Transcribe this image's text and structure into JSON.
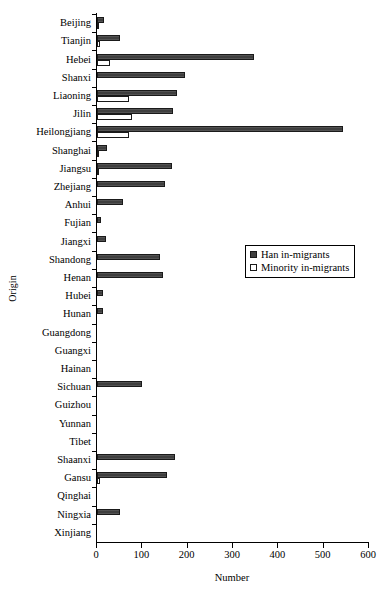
{
  "chart_data": {
    "type": "bar",
    "orientation": "horizontal",
    "title": "",
    "xlabel": "Number",
    "ylabel": "Origin",
    "xlim": [
      0,
      600
    ],
    "xticks": [
      0,
      100,
      200,
      300,
      400,
      500,
      600
    ],
    "grid": false,
    "legend_position": "middle-right",
    "categories": [
      "Beijing",
      "Tianjin",
      "Hebei",
      "Shanxi",
      "Liaoning",
      "Jilin",
      "Heilongjiang",
      "Shanghai",
      "Jiangsu",
      "Zhejiang",
      "Anhui",
      "Fujian",
      "Jiangxi",
      "Shandong",
      "Henan",
      "Hubei",
      "Hunan",
      "Guangdong",
      "Guangxi",
      "Hainan",
      "Sichuan",
      "Guizhou",
      "Yunnan",
      "Tibet",
      "Shaanxi",
      "Gansu",
      "Qinghai",
      "Ningxia",
      "Xinjiang"
    ],
    "series": [
      {
        "name": "Han in-migrants",
        "color": "#3f3f3f",
        "values": [
          15,
          51,
          346,
          194,
          176,
          168,
          542,
          22,
          165,
          150,
          57,
          9,
          20,
          140,
          145,
          13,
          13,
          0,
          0,
          0,
          99,
          0,
          0,
          0,
          171,
          154,
          0,
          51,
          0
        ]
      },
      {
        "name": "Minority in-migrants",
        "color": "#ffffff",
        "values": [
          5,
          7,
          29,
          0,
          70,
          77,
          71,
          3,
          5,
          0,
          0,
          0,
          0,
          0,
          0,
          0,
          0,
          0,
          0,
          0,
          0,
          0,
          0,
          0,
          0,
          7,
          0,
          0,
          0
        ]
      }
    ]
  }
}
